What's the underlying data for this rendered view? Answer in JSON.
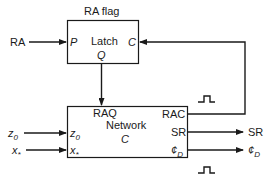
{
  "latch": {
    "title": "RA flag",
    "name": "Latch",
    "ports": {
      "input": "P",
      "clock": "C",
      "output": "Q"
    }
  },
  "network": {
    "name": "Network",
    "id": "C",
    "inputs": [
      {
        "main": "z",
        "sub": "0"
      },
      {
        "main": "x",
        "sub": "*"
      }
    ],
    "top_label": "RAQ",
    "outputs": [
      {
        "main": "RAC",
        "sub": ""
      },
      {
        "main": "SR",
        "sub": ""
      },
      {
        "main": "¢",
        "sub": "D"
      }
    ]
  },
  "external": {
    "ra_input": "RA",
    "z0": {
      "main": "z",
      "sub": "0"
    },
    "xstar": {
      "main": "x",
      "sub": "*"
    },
    "sr_out": "SR",
    "phid_out": {
      "main": "¢",
      "sub": "D"
    }
  },
  "icons": [
    "pulse-icon",
    "pulse-icon"
  ],
  "colors": {
    "line": "#1a1a1a",
    "background": "#ffffff"
  }
}
